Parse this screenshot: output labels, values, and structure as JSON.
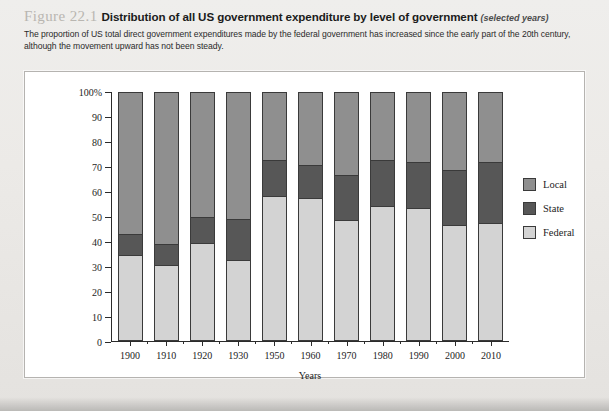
{
  "figure": {
    "number": "Figure 22.1",
    "title": "Distribution of all US government expenditure by level of government",
    "qualifier": "(selected years)",
    "subtitle": "The proportion of US total direct government expenditures made by the federal government has increased since the early part of the 20th century, although the movement upward has not been steady."
  },
  "legend": {
    "position": "right",
    "items": [
      {
        "label": "Local",
        "color": "#8f8f8f"
      },
      {
        "label": "State",
        "color": "#575757"
      },
      {
        "label": "Federal",
        "color": "#d3d3d3"
      }
    ]
  },
  "axes": {
    "y_title": "Percent of US government expenditure",
    "x_title": "Years",
    "y_ticks": [
      "100%",
      "90",
      "80",
      "70",
      "60",
      "50",
      "40",
      "30",
      "20",
      "10",
      "0"
    ]
  },
  "chart_data": {
    "type": "bar",
    "subtype": "stacked-vertical-100percent",
    "title": "Distribution of all US government expenditure by level of government",
    "xlabel": "Years",
    "ylabel": "Percent of US government expenditure",
    "ylim": [
      0,
      100
    ],
    "ytick_step": 10,
    "grid": false,
    "legend_position": "right",
    "categories": [
      "1900",
      "1910",
      "1920",
      "1930",
      "1950",
      "1960",
      "1970",
      "1980",
      "1990",
      "2000",
      "2010"
    ],
    "series": [
      {
        "name": "Federal",
        "color": "#d3d3d3",
        "values": [
          34,
          30,
          39,
          32,
          58,
          57,
          48,
          54,
          53,
          46,
          47
        ]
      },
      {
        "name": "State",
        "color": "#575757",
        "values": [
          9,
          9,
          11,
          17,
          15,
          14,
          19,
          19,
          19,
          23,
          25
        ]
      },
      {
        "name": "Local",
        "color": "#8f8f8f",
        "values": [
          57,
          61,
          50,
          51,
          27,
          29,
          33,
          27,
          28,
          31,
          28
        ]
      }
    ],
    "cumulative_tops": {
      "federal": [
        34,
        30,
        39,
        32,
        58,
        57,
        48,
        54,
        53,
        46,
        47
      ],
      "state": [
        43,
        39,
        50,
        49,
        73,
        71,
        67,
        73,
        72,
        69,
        72
      ],
      "local": [
        100,
        100,
        100,
        100,
        100,
        100,
        100,
        100,
        100,
        100,
        100
      ]
    }
  }
}
